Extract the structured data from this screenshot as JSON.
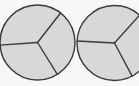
{
  "figure": {
    "name": "fraction-circles-thirds",
    "background_color": "#f7f7f5",
    "sector_fill": "#d8d8d6",
    "outline_color": "#3a3a3a",
    "outline_width": 1.4,
    "radius_line_width": 1.4,
    "canvas": {
      "width": 139,
      "height": 86
    },
    "shapes": [
      {
        "id": "circle-left",
        "label": "Left circle divided into thirds",
        "center_x": 37.5,
        "center_y": 42.5,
        "radius": 37.5,
        "sector_count": 3,
        "division_angles_deg": [
          -52,
          58,
          176
        ],
        "sectors": [
          {
            "id": "left-sector-top",
            "start_deg": 176,
            "end_deg": -52,
            "fraction": "1/3"
          },
          {
            "id": "left-sector-right",
            "start_deg": -52,
            "end_deg": 58,
            "fraction": "1/3"
          },
          {
            "id": "left-sector-bottom",
            "start_deg": 58,
            "end_deg": 176,
            "fraction": "1/3"
          }
        ]
      },
      {
        "id": "circle-right",
        "label": "Right circle divided into thirds, cropped at right edge",
        "center_x": 114.5,
        "center_y": 43,
        "radius": 37.5,
        "sector_count": 3,
        "division_angles_deg": [
          -48,
          62,
          183
        ],
        "sectors": [
          {
            "id": "right-sector-top",
            "start_deg": 183,
            "end_deg": -48,
            "fraction": "1/3"
          },
          {
            "id": "right-sector-right",
            "start_deg": -48,
            "end_deg": 62,
            "fraction": "1/3"
          },
          {
            "id": "right-sector-bottom",
            "start_deg": 62,
            "end_deg": 183,
            "fraction": "1/3"
          }
        ]
      }
    ]
  }
}
